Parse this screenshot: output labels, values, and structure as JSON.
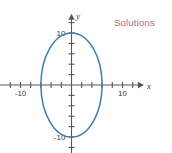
{
  "figure": {
    "width": 172,
    "height": 153,
    "background": "#ffffff"
  },
  "annotation": {
    "label": "Solutions",
    "color": "#b5687f",
    "x": 114,
    "y": 17
  },
  "chart_data": {
    "type": "line",
    "title": "",
    "subtitle": "",
    "xlabel": "x",
    "ylabel": "y",
    "xlim": [
      -14,
      14
    ],
    "ylim": [
      -13.5,
      13.5
    ],
    "grid": false,
    "legend": null,
    "tick_interval": 2,
    "x_tick_labels": [
      {
        "value": -10,
        "text": "-10"
      },
      {
        "value": 10,
        "text": "10"
      }
    ],
    "y_tick_labels": [
      {
        "value": 10,
        "text": "10"
      },
      {
        "value": -10,
        "text": "-10"
      }
    ],
    "x_ticks": [
      -12,
      -10,
      -8,
      -6,
      -4,
      -2,
      2,
      4,
      6,
      8,
      10,
      12
    ],
    "y_ticks": [
      -12,
      -10,
      -8,
      -6,
      -4,
      -2,
      2,
      4,
      6,
      8,
      10,
      12
    ],
    "series": [
      {
        "name": "ellipse",
        "shape": "ellipse",
        "color": "#3d7cb5",
        "center": [
          0,
          0
        ],
        "semi_axis_x": 6,
        "semi_axis_y": 10,
        "equation": "x^2/36 + y^2/100 = 1",
        "x_intercepts": [
          -6,
          6
        ],
        "y_intercepts": [
          -10,
          10
        ]
      }
    ]
  }
}
